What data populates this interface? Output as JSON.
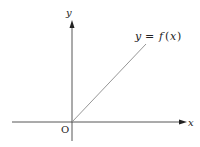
{
  "diagram": {
    "type": "function-graph",
    "axes": {
      "x_label": "x",
      "y_label": "y",
      "origin_label": "O",
      "color": "#333333"
    },
    "curve": {
      "label_y": "y",
      "label_eq": "=",
      "label_f": "f",
      "label_open": "(",
      "label_x": "x",
      "label_close": ")",
      "shape": "ray from origin with positive slope",
      "color": "#888888"
    }
  }
}
